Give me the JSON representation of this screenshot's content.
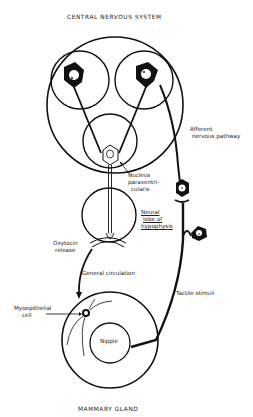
{
  "diagram": {
    "title_top": "CENTRAL NERVOUS SYSTEM",
    "title_bottom": "MAMMARY GLAND",
    "labels": {
      "afferent_line1": "Afferent",
      "afferent_line2": "nervous pathway",
      "nucleus_line1": "Nucleus",
      "nucleus_line2": "paraventri-",
      "nucleus_line3": "cularis",
      "neural_line1": "Neural",
      "neural_line2": "lobe of",
      "neural_line3": "hypophysis",
      "oxytocin_line1": "Oxytocin",
      "oxytocin_line2": "release",
      "general_circulation": "General circulation",
      "tactile_stimuli": "Tactile stimuli",
      "myoepithelial_line1": "Myoepithelial",
      "myoepithelial_line2": "cell",
      "nipple": "Nipple"
    },
    "colors": {
      "ink": "#111111",
      "background": "#ffffff"
    }
  }
}
